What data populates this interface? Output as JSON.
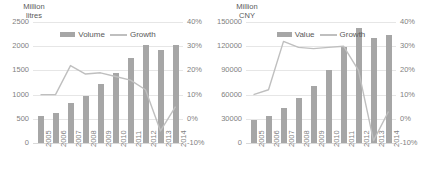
{
  "chart_data": [
    {
      "type": "bar",
      "title": "Million\nlitres",
      "xlabel": "",
      "ylabel": "Million litres",
      "categories": [
        "2005",
        "2006",
        "2007",
        "2008",
        "2009",
        "2010",
        "2011",
        "2012",
        "2013",
        "2014"
      ],
      "ytick_labels": [
        "2500",
        "2000",
        "1500",
        "1000",
        "500",
        "0"
      ],
      "ytick_values": [
        2500,
        2000,
        1500,
        1000,
        500,
        0
      ],
      "ylim": [
        0,
        2500
      ],
      "y2tick_labels": [
        "40%",
        "30%",
        "20%",
        "10%",
        "0%",
        "-10%"
      ],
      "y2tick_values": [
        40,
        30,
        20,
        10,
        0,
        -10
      ],
      "y2lim": [
        -10,
        40
      ],
      "grid": true,
      "legend_position": "top-center",
      "series": [
        {
          "name": "Volume",
          "kind": "bar",
          "axis": "left",
          "color": "#a6a6a6",
          "values": [
            560,
            620,
            820,
            980,
            1210,
            1440,
            1760,
            2030,
            1930,
            2020
          ]
        },
        {
          "name": "Growth",
          "kind": "line",
          "axis": "right",
          "color": "#bfbfbf",
          "values": [
            10,
            10,
            22,
            18.5,
            19,
            17.5,
            16,
            12,
            -5,
            5
          ]
        }
      ]
    },
    {
      "type": "bar",
      "title": "Million\nCNY",
      "xlabel": "",
      "ylabel": "Million CNY",
      "categories": [
        "2005",
        "2006",
        "2007",
        "2008",
        "2009",
        "2010",
        "2011",
        "2012",
        "2013",
        "2014"
      ],
      "ytick_labels": [
        "150000",
        "120000",
        "90000",
        "60000",
        "30000",
        "0"
      ],
      "ytick_values": [
        150000,
        120000,
        90000,
        60000,
        30000,
        0
      ],
      "ylim": [
        0,
        150000
      ],
      "y2tick_labels": [
        "40%",
        "30%",
        "20%",
        "10%",
        "0%",
        "-10%"
      ],
      "y2tick_values": [
        40,
        30,
        20,
        10,
        0,
        -10
      ],
      "y2lim": [
        -10,
        40
      ],
      "grid": true,
      "legend_position": "top-center",
      "series": [
        {
          "name": "Value",
          "kind": "bar",
          "axis": "left",
          "color": "#a6a6a6",
          "values": [
            29000,
            34000,
            43000,
            56000,
            71000,
            91000,
            119000,
            143000,
            130000,
            134000
          ]
        },
        {
          "name": "Growth",
          "kind": "line",
          "axis": "right",
          "color": "#bfbfbf",
          "values": [
            10,
            12,
            32,
            29.5,
            29,
            29.5,
            30,
            20,
            -9,
            3
          ]
        }
      ]
    }
  ],
  "colors": {
    "bar": "#a6a6a6",
    "line": "#bfbfbf",
    "grid": "#e6e6e6",
    "text": "#595959",
    "tick_text": "#7f7f7f",
    "background": "#ffffff"
  }
}
